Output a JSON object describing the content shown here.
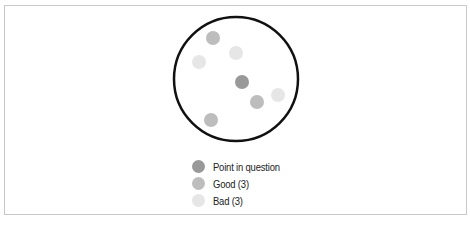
{
  "diagram": {
    "boundary_circle": {
      "cx": 236,
      "cy": 79,
      "r": 62,
      "stroke": "#111111"
    },
    "points": [
      {
        "type": "question",
        "cx": 242,
        "cy": 82,
        "color": "#999999"
      },
      {
        "type": "good",
        "cx": 213,
        "cy": 38,
        "color": "#bdbdbd"
      },
      {
        "type": "good",
        "cx": 257,
        "cy": 102,
        "color": "#bdbdbd"
      },
      {
        "type": "good",
        "cx": 211,
        "cy": 120,
        "color": "#bdbdbd"
      },
      {
        "type": "bad",
        "cx": 236,
        "cy": 53,
        "color": "#e6e6e6"
      },
      {
        "type": "bad",
        "cx": 199,
        "cy": 62,
        "color": "#e6e6e6"
      },
      {
        "type": "bad",
        "cx": 278,
        "cy": 95,
        "color": "#e6e6e6"
      }
    ]
  },
  "legend": {
    "items": [
      {
        "label": "Point in question",
        "color": "#999999"
      },
      {
        "label": "Good (3)",
        "color": "#bdbdbd"
      },
      {
        "label": "Bad (3)",
        "color": "#e6e6e6"
      }
    ]
  }
}
